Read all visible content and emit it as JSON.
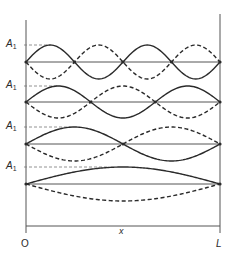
{
  "diagram": {
    "amplitude_label": "A",
    "amplitude_subscript": "1",
    "x_axis_label": "x",
    "origin_label": "O",
    "end_label": "L",
    "colors": {
      "stroke": "#2a2a2a",
      "axis": "#555555",
      "dashed_ref": "#777777",
      "background": "#ffffff"
    },
    "geometry": {
      "x_start": 26,
      "x_end": 220,
      "axis_top": 14,
      "axis_bottom": 233,
      "bottom_axis_y": 226
    },
    "modes": [
      {
        "n": 4,
        "baseline_y": 62,
        "amplitude_px": 17,
        "ref_line_end_x": 50
      },
      {
        "n": 3,
        "baseline_y": 102,
        "amplitude_px": 16,
        "ref_line_end_x": 58
      },
      {
        "n": 2,
        "baseline_y": 144,
        "amplitude_px": 17,
        "ref_line_end_x": 74
      },
      {
        "n": 1,
        "baseline_y": 184,
        "amplitude_px": 17,
        "ref_line_end_x": 108
      }
    ]
  }
}
